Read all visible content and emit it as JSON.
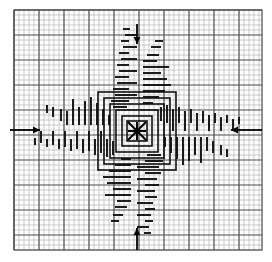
{
  "figure": {
    "title": "",
    "canvas": {
      "width": 272,
      "height": 262,
      "background": "#ffffff"
    },
    "grid": {
      "name": "graph-paper-grid",
      "x0": 14,
      "y0": 10,
      "x1": 262,
      "y1": 250,
      "minor_step": 5,
      "major_every": 5,
      "minor_color": "#b4b4b4",
      "major_color": "#4a4a4a",
      "minor_width": 0.7,
      "major_width": 1.2,
      "border_color": "#4a4a4a"
    },
    "center_marker": {
      "name": "center-asterisk-marker",
      "glyph": "asterisk",
      "x": 137,
      "y": 131,
      "radius": 9,
      "color": "#000000",
      "stroke": 2.1
    },
    "arrows": [
      {
        "name": "arrow-top",
        "direction": "down",
        "x1": 137,
        "y1": 24,
        "x2": 137,
        "y2": 44,
        "color": "#000000"
      },
      {
        "name": "arrow-bottom",
        "direction": "up",
        "x1": 137,
        "y1": 250,
        "x2": 137,
        "y2": 228,
        "color": "#000000"
      },
      {
        "name": "arrow-left",
        "direction": "right",
        "x1": 10,
        "y1": 130,
        "x2": 40,
        "y2": 130,
        "color": "#000000"
      },
      {
        "name": "arrow-right",
        "direction": "left",
        "x1": 262,
        "y1": 130,
        "x2": 231,
        "y2": 130,
        "color": "#000000"
      }
    ],
    "pattern": {
      "name": "pinwheel-contour-pattern",
      "symmetry": "4-fold rotational",
      "color": "#111111",
      "description": "dense horizontal and vertical line-segment hatching forming a rotationally symmetric spiral arm set with nested square contours at the core",
      "rings": [
        {
          "half": 10,
          "stroke": 1.6
        },
        {
          "half": 15,
          "stroke": 1.6
        },
        {
          "half": 21,
          "stroke": 1.6
        },
        {
          "half": 27,
          "stroke": 1.6
        },
        {
          "half": 33,
          "stroke": 1.6
        },
        {
          "half": 39,
          "stroke": 1.6
        }
      ],
      "arm_segments": [
        {
          "ox": 6,
          "oy": -28,
          "len": 10,
          "orient": "h",
          "w": 1.9
        },
        {
          "ox": 6,
          "oy": -34,
          "len": 16,
          "orient": "h",
          "w": 1.9
        },
        {
          "ox": 6,
          "oy": -40,
          "len": 22,
          "orient": "h",
          "w": 1.9
        },
        {
          "ox": 6,
          "oy": -46,
          "len": 28,
          "orient": "h",
          "w": 1.9
        },
        {
          "ox": 6,
          "oy": -52,
          "len": 24,
          "orient": "h",
          "w": 1.9
        },
        {
          "ox": 6,
          "oy": -58,
          "len": 18,
          "orient": "h",
          "w": 1.9
        },
        {
          "ox": 6,
          "oy": -64,
          "len": 26,
          "orient": "h",
          "w": 1.9
        },
        {
          "ox": 6,
          "oy": -70,
          "len": 14,
          "orient": "h",
          "w": 1.9
        },
        {
          "ox": 10,
          "oy": -76,
          "len": 12,
          "orient": "h",
          "w": 1.9
        },
        {
          "ox": 14,
          "oy": -84,
          "len": 10,
          "orient": "h",
          "w": 1.9
        },
        {
          "ox": 18,
          "oy": -90,
          "len": 8,
          "orient": "h",
          "w": 1.9
        },
        {
          "ox": 24,
          "oy": -24,
          "len": 14,
          "orient": "v",
          "w": 1.9
        },
        {
          "ox": 30,
          "oy": -26,
          "len": 18,
          "orient": "v",
          "w": 1.9
        },
        {
          "ox": 36,
          "oy": -22,
          "len": 22,
          "orient": "v",
          "w": 1.9
        },
        {
          "ox": 42,
          "oy": -24,
          "len": 16,
          "orient": "v",
          "w": 1.9
        },
        {
          "ox": 48,
          "oy": -20,
          "len": 20,
          "orient": "v",
          "w": 1.9
        },
        {
          "ox": 54,
          "oy": -22,
          "len": 14,
          "orient": "v",
          "w": 1.9
        },
        {
          "ox": 60,
          "oy": -18,
          "len": 18,
          "orient": "v",
          "w": 1.9
        },
        {
          "ox": 66,
          "oy": -20,
          "len": 12,
          "orient": "v",
          "w": 1.9
        },
        {
          "ox": 72,
          "oy": -16,
          "len": 16,
          "orient": "v",
          "w": 1.9
        },
        {
          "ox": 78,
          "oy": -18,
          "len": 10,
          "orient": "v",
          "w": 1.9
        },
        {
          "ox": 84,
          "oy": -14,
          "len": 14,
          "orient": "v",
          "w": 1.9
        },
        {
          "ox": 90,
          "oy": -16,
          "len": 8,
          "orient": "v",
          "w": 1.9
        },
        {
          "ox": 96,
          "oy": -12,
          "len": 12,
          "orient": "v",
          "w": 1.9
        },
        {
          "ox": 102,
          "oy": -14,
          "len": 7,
          "orient": "v",
          "w": 1.9
        }
      ]
    }
  }
}
